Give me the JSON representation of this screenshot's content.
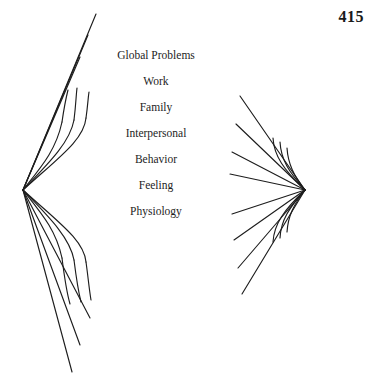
{
  "page": {
    "number": "415",
    "background_color": "#ffffff",
    "ink_color": "#1d1d1d"
  },
  "labels": {
    "items": [
      {
        "text": "Global Problems"
      },
      {
        "text": "Work"
      },
      {
        "text": "Family"
      },
      {
        "text": "Interpersonal"
      },
      {
        "text": "Behavior"
      },
      {
        "text": "Feeling"
      },
      {
        "text": "Physiology"
      }
    ]
  },
  "figures": {
    "left": {
      "name": "left-fan-diagram",
      "vertex": {
        "x": 23,
        "y": 190
      },
      "description": "lines converging at a left vertex, opening rightward, with three arcs bulging rightward",
      "rays": [
        {
          "x2": 96,
          "y2": 14
        },
        {
          "x2": 88,
          "y2": 35
        },
        {
          "x2": 80,
          "y2": 57
        },
        {
          "x2": 90,
          "y2": 318
        },
        {
          "x2": 80,
          "y2": 345
        },
        {
          "x2": 72,
          "y2": 372
        }
      ],
      "arcs": [
        {
          "top": {
            "x": 54,
            "y": 122
          },
          "bottom": {
            "x": 54,
            "y": 258
          },
          "bulge": 18
        },
        {
          "top": {
            "x": 50,
            "y": 128
          },
          "bottom": {
            "x": 50,
            "y": 252
          },
          "bulge": 28
        },
        {
          "top": {
            "x": 46,
            "y": 134
          },
          "bottom": {
            "x": 46,
            "y": 246
          },
          "bulge": 40
        }
      ]
    },
    "right": {
      "name": "right-fan-diagram",
      "vertex": {
        "x": 305,
        "y": 190
      },
      "description": "lines converging at a right vertex, opening leftward, with three nested arcs bulging leftward",
      "rays": [
        {
          "x2": 240,
          "y2": 96
        },
        {
          "x2": 236,
          "y2": 124
        },
        {
          "x2": 232,
          "y2": 152
        },
        {
          "x2": 230,
          "y2": 174
        },
        {
          "x2": 232,
          "y2": 214
        },
        {
          "x2": 234,
          "y2": 240
        },
        {
          "x2": 238,
          "y2": 268
        },
        {
          "x2": 242,
          "y2": 294
        }
      ],
      "arcs": [
        {
          "top": {
            "x": 286,
            "y": 148
          },
          "bottom": {
            "x": 286,
            "y": 232
          },
          "bulge": 12
        },
        {
          "top": {
            "x": 280,
            "y": 142
          },
          "bottom": {
            "x": 280,
            "y": 238
          },
          "bulge": 20
        },
        {
          "top": {
            "x": 274,
            "y": 138
          },
          "bottom": {
            "x": 274,
            "y": 242
          },
          "bulge": 28
        }
      ]
    }
  }
}
